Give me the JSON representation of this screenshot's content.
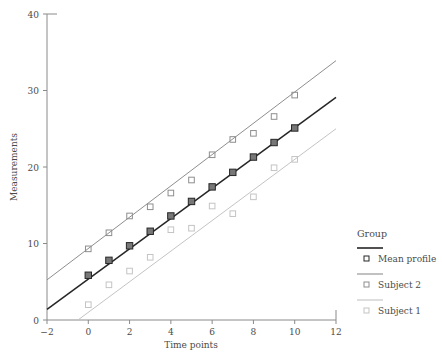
{
  "chart_data": {
    "type": "scatter",
    "title": "",
    "xlabel": "Time points",
    "ylabel": "Measurements",
    "xlim": [
      -2,
      12
    ],
    "ylim": [
      0,
      40
    ],
    "xticks": [
      -2,
      0,
      2,
      4,
      6,
      8,
      10,
      12
    ],
    "yticks": [
      0,
      10,
      20,
      30,
      40
    ],
    "grid": false,
    "legend_position": "right",
    "legend_title": "Group",
    "series": [
      {
        "name": "Subject 2",
        "color": "#8e8e8e",
        "marker": "open-square",
        "fit_intercept": 9.35,
        "fit_slope": 2.05,
        "x": [
          0,
          1,
          2,
          3,
          4,
          5,
          6,
          7,
          8,
          9,
          10
        ],
        "y": [
          9.3,
          11.4,
          13.6,
          14.8,
          16.6,
          18.3,
          21.6,
          23.6,
          24.4,
          26.6,
          29.4
        ]
      },
      {
        "name": "Mean profile",
        "color": "#262626",
        "marker": "filled-square",
        "fit_intercept": 5.85,
        "fit_slope": 1.93,
        "x": [
          0,
          1,
          2,
          3,
          4,
          5,
          6,
          7,
          8,
          9,
          10
        ],
        "y": [
          5.85,
          7.8,
          9.7,
          11.6,
          13.6,
          15.5,
          17.4,
          19.3,
          21.3,
          23.2,
          25.1
        ]
      },
      {
        "name": "Subject 1",
        "color": "#c4c4c4",
        "marker": "open-square",
        "fit_intercept": 2.0,
        "fit_slope": 1.9,
        "x": [
          0,
          1,
          2,
          3,
          4,
          5,
          6,
          7,
          8,
          9,
          10
        ],
        "y": [
          2.0,
          4.6,
          6.4,
          8.2,
          11.8,
          12.0,
          14.9,
          13.9,
          16.1,
          19.9,
          21.0
        ]
      }
    ],
    "fit_lines": [
      {
        "name": "Subject 2",
        "x0": -2,
        "y0": 5.25,
        "x1": 12,
        "y1": 33.9,
        "color": "#8e8e8e"
      },
      {
        "name": "Mean profile",
        "x0": -2,
        "y0": 1.4,
        "x1": 12,
        "y1": 29.1,
        "color": "#262626"
      },
      {
        "name": "Subject 1",
        "x0": -0.5,
        "y0": 0.0,
        "x1": 12,
        "y1": 25.0,
        "color": "#c4c4c4"
      }
    ],
    "legend_entries": [
      {
        "label": "Mean profile",
        "color": "#262626",
        "marker": "square"
      },
      {
        "label": "Subject 2",
        "color": "#8e8e8e",
        "marker": "square"
      },
      {
        "label": "Subject 1",
        "color": "#c4c4c4",
        "marker": "square"
      }
    ],
    "axis_color": "#8a8a8a",
    "text_color": "#4a4a4a",
    "background": "#ffffff"
  },
  "labels": {
    "xtick_texts": [
      "−2",
      "0",
      "2",
      "4",
      "6",
      "8",
      "10",
      "12"
    ],
    "ytick_texts": [
      "0",
      "10",
      "20",
      "30",
      "40"
    ]
  }
}
